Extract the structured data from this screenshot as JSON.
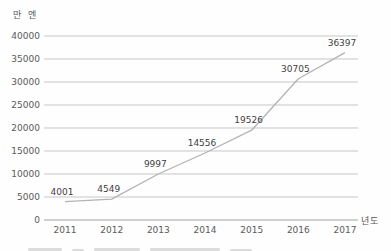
{
  "chart_data": {
    "type": "line",
    "categories": [
      "2011",
      "2012",
      "2013",
      "2014",
      "2015",
      "2016",
      "2017"
    ],
    "values": [
      4001,
      4549,
      9997,
      14556,
      19526,
      30705,
      36397
    ],
    "title": "",
    "ylabel": "만 엔",
    "xlabel": "년도",
    "ylim": [
      0,
      40000
    ],
    "ytick_step": 5000,
    "yticks": [
      0,
      5000,
      10000,
      15000,
      20000,
      25000,
      30000,
      35000,
      40000
    ],
    "grid": true,
    "legend": "none",
    "data_labels_shown": true,
    "colors": {
      "line": "#b3b3b3",
      "grid": "#c7c7c7",
      "axis": "#a3a3a3",
      "text": "#5a5a5a",
      "data_label": "#3f3f3f",
      "background": "#fefefe"
    }
  }
}
